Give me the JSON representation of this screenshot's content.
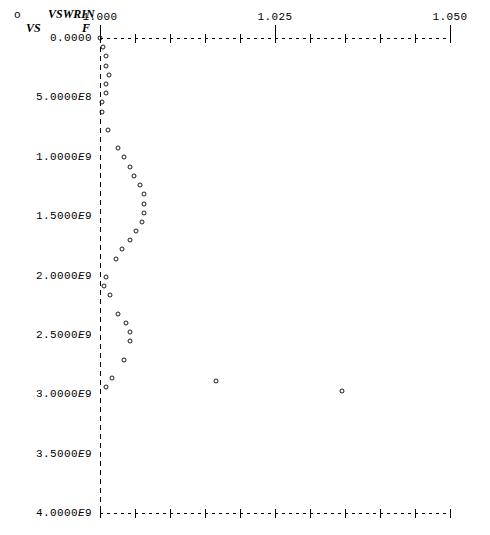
{
  "header": {
    "series_symbol": "o",
    "series_name": "VSWRIN",
    "vs_label": "VS",
    "x_variable": "F"
  },
  "chart_data": {
    "type": "scatter",
    "title": "VSWRIN VS F",
    "xlabel": "VSWRIN",
    "ylabel": "F",
    "marker": "open-circle",
    "grid": false,
    "legend_position": "top-left",
    "legend_entries": [
      "VSWRIN"
    ],
    "xlim": [
      1.0,
      1.05
    ],
    "ylim": [
      0.0,
      4000000000
    ],
    "xticks": [
      1.0,
      1.025,
      1.05
    ],
    "xtick_labels": [
      "1.000",
      "1.025",
      "1.050"
    ],
    "xtick_minor_count": 10,
    "yticks": [
      0,
      500000000,
      1000000000,
      1500000000,
      2000000000,
      2500000000,
      3000000000,
      3500000000,
      4000000000
    ],
    "ytick_labels": [
      "0.0000",
      "5.0000E8",
      "1.0000E9",
      "1.5000E9",
      "2.0000E9",
      "2.5000E9",
      "3.0000E9",
      "3.5000E9",
      "4.0000E9"
    ],
    "x": [
      1.0,
      1.0004,
      1.0009,
      1.0009,
      1.0013,
      1.0009,
      1.0009,
      1.0003,
      1.0003,
      1.0012,
      1.0026,
      1.0034,
      1.0043,
      1.0049,
      1.0057,
      1.0063,
      1.0063,
      1.0063,
      1.006,
      1.0051,
      1.0043,
      1.0031,
      1.0023,
      1.0009,
      1.0006,
      1.0014,
      1.0026,
      1.0037,
      1.0043,
      1.0043,
      1.0034,
      1.0017,
      1.0009,
      1.0166,
      1.0346
    ],
    "y": [
      0,
      77000000,
      155000000,
      232000000,
      310000000,
      387000000,
      464000000,
      542000000,
      619000000,
      774000000,
      929000000,
      1006000000,
      1084000000,
      1161000000,
      1239000000,
      1316000000,
      1394000000,
      1471000000,
      1548000000,
      1626000000,
      1703000000,
      1781000000,
      1858000000,
      2013000000,
      2091000000,
      2168000000,
      2323000000,
      2400000000,
      2478000000,
      2555000000,
      2710000000,
      2865000000,
      2942000000,
      2890000000,
      2975000000
    ],
    "axis_style": "dashed-ascii"
  }
}
